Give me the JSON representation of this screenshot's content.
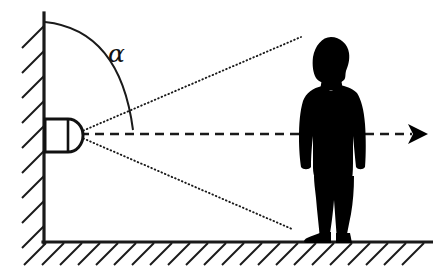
{
  "diagram": {
    "canvas": {
      "width": 433,
      "height": 272,
      "background": "#ffffff"
    },
    "colors": {
      "ink": "#1a1a1a",
      "silhouette": "#000000",
      "background": "#ffffff",
      "sensor_fill": "#ffffff"
    },
    "labels": {
      "angle_symbol": "α"
    },
    "elements": {
      "wall": {
        "name": "wall",
        "hatch_direction": "up-right",
        "hatch_count": 9
      },
      "ground": {
        "name": "ground",
        "hatch_direction": "down-left",
        "hatch_count": 21
      },
      "sensor": {
        "name": "motion-sensor",
        "shape": "rectangle-with-dome"
      },
      "angle_arc": {
        "name": "angle-arc",
        "symbol": "α"
      },
      "rays": [
        {
          "name": "upper-detection-ray",
          "style": "dotted"
        },
        {
          "name": "lower-detection-ray",
          "style": "dotted"
        }
      ],
      "axis": {
        "name": "center-axis-arrow",
        "style": "dashed-with-arrowhead",
        "direction": "right"
      },
      "person": {
        "name": "person-silhouette",
        "pose": "standing",
        "fill": "#000000"
      }
    }
  }
}
